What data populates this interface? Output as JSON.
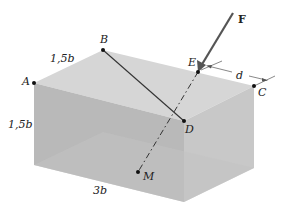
{
  "figure": {
    "points": {
      "A": "A",
      "B": "B",
      "C": "C",
      "D": "D",
      "E": "E",
      "M": "M"
    },
    "force_label": "F",
    "distance_label": "d",
    "dimensions": {
      "top_depth": "1,5b",
      "height": "1,5b",
      "length": "3b"
    },
    "colors": {
      "top_face": "#d4d4d4",
      "front_face": "#b8b8b8",
      "side_face": "#c6c6c6",
      "edge": "#333333",
      "force_arrow": "#555555"
    }
  }
}
